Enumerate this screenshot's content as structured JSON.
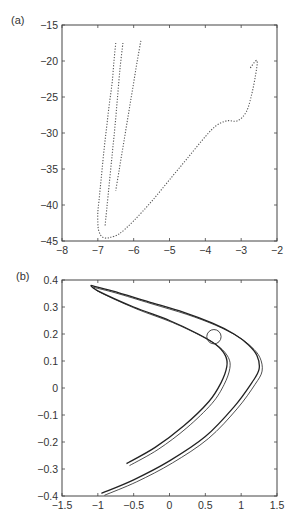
{
  "chart_data": [
    {
      "panel": "(a)",
      "type": "scatter",
      "title": "",
      "xlabel": "",
      "ylabel": "",
      "xlim": [
        -8,
        -2
      ],
      "ylim": [
        -45,
        -15
      ],
      "xticks": [
        -8,
        -7,
        -6,
        -5,
        -4,
        -3,
        -2
      ],
      "yticks": [
        -15,
        -20,
        -25,
        -30,
        -35,
        -40,
        -45
      ],
      "xtick_labels": [
        "-8",
        "-7",
        "-6",
        "-5",
        "-4",
        "-3",
        "-2"
      ],
      "ytick_labels": [
        "-15",
        "-20",
        "-25",
        "-30",
        "-35",
        "-40",
        "-45"
      ],
      "grid": false,
      "legend": null,
      "series": [
        {
          "name": "main branch (outer, dense)",
          "x": [
            -6.5,
            -6.55,
            -6.6,
            -6.68,
            -6.75,
            -6.82,
            -6.88,
            -6.93,
            -6.97,
            -7.0,
            -7.0,
            -6.98,
            -6.92,
            -6.85,
            -6.75,
            -6.65
          ],
          "y": [
            -17.5,
            -20,
            -23,
            -26,
            -29,
            -32,
            -35,
            -37.5,
            -39.5,
            -41,
            -42.5,
            -43.5,
            -44.2,
            -44.5,
            -44.6,
            -44.5
          ]
        },
        {
          "name": "inner branch",
          "x": [
            -6.3,
            -6.38,
            -6.45,
            -6.52,
            -6.6,
            -6.68,
            -6.75,
            -6.8
          ],
          "y": [
            -17.5,
            -21,
            -25,
            -29,
            -33,
            -37,
            -40.5,
            -43
          ]
        },
        {
          "name": "right strand",
          "x": [
            -5.8,
            -5.9,
            -6.0,
            -6.1,
            -6.2,
            -6.3,
            -6.4,
            -6.5
          ],
          "y": [
            -17.2,
            -20,
            -23,
            -26,
            -29,
            -32,
            -35,
            -38
          ]
        },
        {
          "name": "lower right arm",
          "x": [
            -6.65,
            -6.4,
            -6.0,
            -5.5,
            -5.0,
            -4.5,
            -4.0,
            -3.7,
            -3.4,
            -3.1,
            -2.85,
            -2.7,
            -2.6,
            -2.55,
            -2.6,
            -2.75
          ],
          "y": [
            -44.5,
            -44.0,
            -42.2,
            -39.5,
            -36.5,
            -33.5,
            -30.5,
            -29.0,
            -28.3,
            -28.3,
            -27.0,
            -24.5,
            -22.0,
            -20.2,
            -20.0,
            -21.0
          ]
        }
      ]
    },
    {
      "panel": "(b)",
      "type": "line",
      "title": "",
      "xlabel": "",
      "ylabel": "",
      "xlim": [
        -1.5,
        1.5
      ],
      "ylim": [
        -0.4,
        0.4
      ],
      "xticks": [
        -1.5,
        -1,
        -0.5,
        0,
        0.5,
        1,
        1.5
      ],
      "yticks": [
        0.4,
        0.3,
        0.2,
        0.1,
        0,
        -0.1,
        -0.2,
        -0.3,
        -0.4
      ],
      "xtick_labels": [
        "-1.5",
        "-1",
        "-0.5",
        "0",
        "0.5",
        "1",
        "1.5"
      ],
      "ytick_labels": [
        "0.4",
        "0.3",
        "0.2",
        "0.1",
        "0",
        "-0.1",
        "-0.2",
        "-0.3",
        "-0.4"
      ],
      "grid": false,
      "legend": null,
      "annotations": [
        {
          "type": "circle",
          "center": [
            0.62,
            0.19
          ],
          "radius_x": 0.1
        }
      ],
      "series": [
        {
          "name": "outer parabola",
          "x": [
            -0.95,
            -0.5,
            0.0,
            0.5,
            0.9,
            1.15,
            1.25,
            1.22,
            1.1,
            0.9,
            0.6,
            0.2,
            -0.3,
            -0.8,
            -1.1
          ],
          "y": [
            -0.39,
            -0.34,
            -0.27,
            -0.18,
            -0.07,
            0.02,
            0.07,
            0.12,
            0.16,
            0.2,
            0.24,
            0.28,
            0.32,
            0.36,
            0.38
          ]
        },
        {
          "name": "inner parabola",
          "x": [
            -0.6,
            -0.2,
            0.2,
            0.55,
            0.72,
            0.8,
            0.78,
            0.65,
            0.4,
            0.0,
            -0.5,
            -1.0,
            -1.1
          ],
          "y": [
            -0.28,
            -0.22,
            -0.14,
            -0.05,
            0.02,
            0.08,
            0.12,
            0.16,
            0.2,
            0.25,
            0.3,
            0.36,
            0.38
          ]
        }
      ]
    }
  ],
  "panels": {
    "a": {
      "label": "(a)"
    },
    "b": {
      "label": "(b)"
    }
  }
}
